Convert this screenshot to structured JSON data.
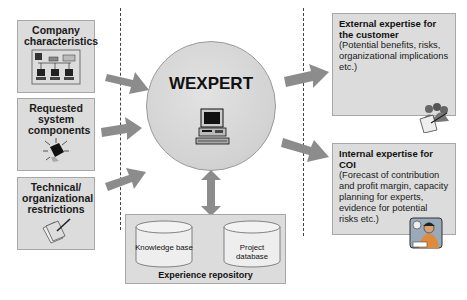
{
  "diagram": {
    "inputs": [
      {
        "label": "Company characteristics",
        "icon": "network-computers-icon"
      },
      {
        "label": "Requested system components",
        "icon": "chip-component-icon"
      },
      {
        "label": "Technical/ organizational restrictions",
        "icon": "documents-pen-icon"
      }
    ],
    "hub": {
      "title": "WEXPERT",
      "icon": "desktop-computer-icon"
    },
    "repository": {
      "title": "Experience repository",
      "stores": [
        {
          "label": "Knowledge base"
        },
        {
          "label": "Project database"
        }
      ]
    },
    "outputs": [
      {
        "title": "External expertise for the customer",
        "body": "(Potential benefits, risks, organizational implications etc.)",
        "icon": "people-document-icon"
      },
      {
        "title": "Internal expertise for COI",
        "body": "(Forecast of contribution and profit margin, capacity planning for experts, evidence for potential risks etc.)",
        "icon": "consultant-person-icon"
      }
    ],
    "colors": {
      "box_fill": "#dcdcdc",
      "arrow_fill": "#8c8c8c",
      "hub_fill": "#d6d6d6",
      "border": "#a8a8a8"
    }
  }
}
